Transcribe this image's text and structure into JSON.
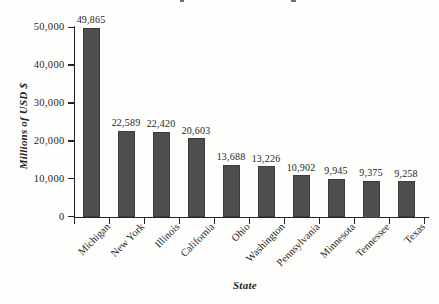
{
  "chart_data": {
    "type": "bar",
    "categories": [
      "Michigan",
      "New York",
      "Illinois",
      "California",
      "Ohio",
      "Washington",
      "Pennsylvania",
      "Minnesota",
      "Tennessee",
      "Texas"
    ],
    "values": [
      49865,
      22589,
      22420,
      20603,
      13688,
      13226,
      10902,
      9945,
      9375,
      9258
    ],
    "value_labels": [
      "49,865",
      "22,589",
      "22,420",
      "20,603",
      "13,688",
      "13,226",
      "10,902",
      "9,945",
      "9,375",
      "9,258"
    ],
    "xlabel": "State",
    "ylabel": "Millions of USD $",
    "ylim": [
      0,
      50000
    ],
    "yticks": [
      0,
      10000,
      20000,
      30000,
      40000,
      50000
    ],
    "ytick_labels": [
      "0",
      "10,000",
      "20,000",
      "30,000",
      "40,000",
      "50,000"
    ],
    "legend": "none",
    "grid": "off",
    "bar_color": "#4e4e4e",
    "axis_color": "#242424",
    "background_color": "#fefefd"
  }
}
